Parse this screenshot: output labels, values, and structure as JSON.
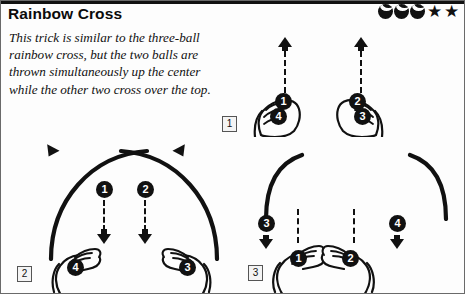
{
  "page": {
    "title": "Rainbow Cross",
    "description": "This trick is similar to the three-ball rainbow cross, but the two balls are thrown simultaneously up the center while the other two cross over the top."
  },
  "rating": {
    "ball_icons": [
      "ball-icon",
      "ball-icon",
      "ball-icon"
    ],
    "star_icons": [
      "star-icon",
      "star-icon"
    ],
    "ball_count": 3,
    "star_count": 2,
    "star_glyph": "★"
  },
  "panels": [
    {
      "label": "1",
      "name": "panel-one",
      "balls": [
        {
          "number": "1",
          "position": "left-hand-upper"
        },
        {
          "number": "4",
          "position": "left-hand-lower"
        },
        {
          "number": "2",
          "position": "right-hand-upper"
        },
        {
          "number": "3",
          "position": "right-hand-lower"
        }
      ],
      "arrows": [
        {
          "direction": "up",
          "side": "left"
        },
        {
          "direction": "up",
          "side": "right"
        }
      ],
      "hands": [
        {
          "side": "left",
          "pose": "closed-grip"
        },
        {
          "side": "right",
          "pose": "closed-grip"
        }
      ]
    },
    {
      "label": "2",
      "name": "panel-two",
      "balls": [
        {
          "number": "1",
          "position": "center-left-falling"
        },
        {
          "number": "2",
          "position": "center-right-falling"
        },
        {
          "number": "4",
          "position": "left-hand"
        },
        {
          "number": "3",
          "position": "right-hand"
        }
      ],
      "arrows": [
        {
          "direction": "down",
          "side": "center-left"
        },
        {
          "direction": "down",
          "side": "center-right"
        },
        {
          "direction": "outward-left",
          "side": "arc-left-end"
        },
        {
          "direction": "outward-right",
          "side": "arc-right-end"
        }
      ],
      "arcs": [
        {
          "name": "crossing-arc-left"
        },
        {
          "name": "crossing-arc-right"
        }
      ],
      "hands": [
        {
          "side": "left",
          "pose": "open-palm"
        },
        {
          "side": "right",
          "pose": "open-palm"
        }
      ]
    },
    {
      "label": "3",
      "name": "panel-three",
      "balls": [
        {
          "number": "3",
          "position": "outer-left-falling"
        },
        {
          "number": "4",
          "position": "outer-right-falling"
        },
        {
          "number": "1",
          "position": "left-hand"
        },
        {
          "number": "2",
          "position": "right-hand"
        }
      ],
      "arrows": [
        {
          "direction": "down",
          "side": "outer-left"
        },
        {
          "direction": "down",
          "side": "outer-right"
        },
        {
          "direction": "down",
          "side": "center-left"
        },
        {
          "direction": "down",
          "side": "center-right"
        }
      ],
      "arcs": [
        {
          "name": "descending-arc-left"
        },
        {
          "name": "descending-arc-right"
        }
      ],
      "hands": [
        {
          "side": "left",
          "pose": "open-catch"
        },
        {
          "side": "right",
          "pose": "open-catch"
        }
      ]
    }
  ],
  "colors": {
    "ink": "#111111",
    "paper": "#fdfdfd",
    "border": "#6a6a6a"
  }
}
